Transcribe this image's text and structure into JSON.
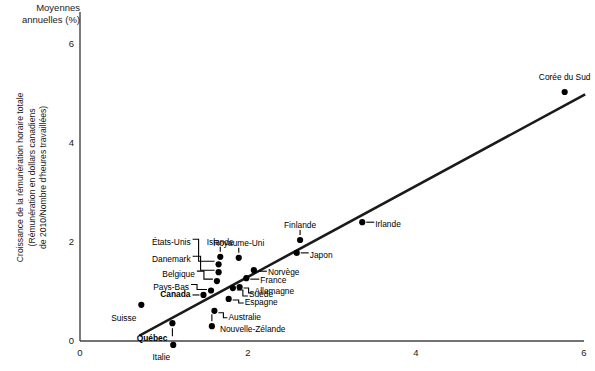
{
  "axes": {
    "unit_title": "Moyennes\nannuelles (%)",
    "y_title": "Croissance de la rémunération horaire totale\n(Rémunération en dollars canadiens\nde 2010/Nombre d'heures travaillées)",
    "y_ticks": [
      "0",
      "2",
      "4",
      "6"
    ],
    "x_ticks": [
      "0",
      "2",
      "4",
      "6"
    ],
    "x_title": ""
  },
  "colors": {
    "background": "#ffffff",
    "axis": "#444444",
    "point": "#000000",
    "trendline": "#1a1a1a",
    "leader": "#000000",
    "text": "#1a1a1a"
  },
  "chart_data": {
    "type": "scatter",
    "title": "",
    "xlabel": "",
    "ylabel": "Croissance de la rémunération horaire totale (Rémunération en dollars canadiens de 2010/Nombre d'heures travaillées)",
    "unit_note": "Moyennes annuelles (%)",
    "xlim": [
      0,
      6
    ],
    "ylim": [
      0,
      6.6
    ],
    "grid": false,
    "legend": null,
    "points": [
      {
        "label": "Suisse",
        "x": 0.73,
        "y": 0.73,
        "bold": false
      },
      {
        "label": "Québec",
        "x": 1.1,
        "y": 0.36,
        "bold": true
      },
      {
        "label": "Italie",
        "x": 1.11,
        "y": -0.08,
        "bold": false
      },
      {
        "label": "Canada",
        "x": 1.47,
        "y": 0.93,
        "bold": true
      },
      {
        "label": "Pays-Bas",
        "x": 1.56,
        "y": 1.02,
        "bold": false
      },
      {
        "label": "Belgique",
        "x": 1.63,
        "y": 1.21,
        "bold": false
      },
      {
        "label": "Danemark",
        "x": 1.65,
        "y": 1.39,
        "bold": false
      },
      {
        "label": "États-Unis",
        "x": 1.65,
        "y": 1.55,
        "bold": false
      },
      {
        "label": "Nouvelle-Zélande",
        "x": 1.57,
        "y": 0.3,
        "bold": false
      },
      {
        "label": "Australie",
        "x": 1.6,
        "y": 0.61,
        "bold": false
      },
      {
        "label": "Espagne",
        "x": 1.77,
        "y": 0.85,
        "bold": false
      },
      {
        "label": "Suède",
        "x": 1.82,
        "y": 1.07,
        "bold": false
      },
      {
        "label": "Allemagne",
        "x": 1.9,
        "y": 1.09,
        "bold": false
      },
      {
        "label": "France",
        "x": 1.98,
        "y": 1.27,
        "bold": false
      },
      {
        "label": "Norvège",
        "x": 2.07,
        "y": 1.43,
        "bold": false
      },
      {
        "label": "Islande",
        "x": 1.67,
        "y": 1.7,
        "bold": false
      },
      {
        "label": "Royaume-Uni",
        "x": 1.89,
        "y": 1.68,
        "bold": false
      },
      {
        "label": "Japon",
        "x": 2.58,
        "y": 1.78,
        "bold": false
      },
      {
        "label": "Finlande",
        "x": 2.62,
        "y": 2.04,
        "bold": false
      },
      {
        "label": "Irlande",
        "x": 3.36,
        "y": 2.4,
        "bold": false
      },
      {
        "label": "Corée du Sud",
        "x": 5.77,
        "y": 5.03,
        "bold": false
      }
    ],
    "trendline": {
      "x0": 0.72,
      "y0": 0.12,
      "x1": 6.0,
      "y1": 4.97
    }
  }
}
